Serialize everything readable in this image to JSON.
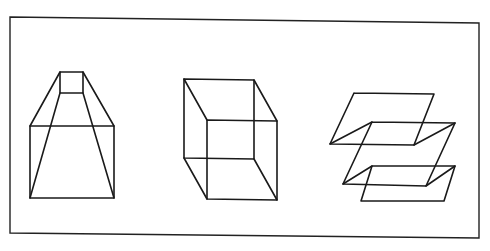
{
  "figure": {
    "frame": [
      [
        10,
        17
      ],
      [
        479,
        23
      ],
      [
        479,
        238
      ],
      [
        10,
        233
      ]
    ],
    "line_color": "#1a1a1a",
    "background": "#ffffff",
    "shapes": [
      {
        "name": "truncated-pyramid",
        "polylines": [
          [
            [
              60,
              72
            ],
            [
              83,
              72
            ],
            [
              83,
              93
            ],
            [
              60,
              93
            ],
            [
              60,
              72
            ]
          ],
          [
            [
              30,
              126
            ],
            [
              114,
              126
            ],
            [
              114,
              198
            ],
            [
              30,
              198
            ],
            [
              30,
              126
            ]
          ],
          [
            [
              60,
              72
            ],
            [
              30,
              126
            ]
          ],
          [
            [
              83,
              72
            ],
            [
              114,
              126
            ]
          ],
          [
            [
              60,
              93
            ],
            [
              30,
              198
            ]
          ],
          [
            [
              83,
              93
            ],
            [
              114,
              198
            ]
          ]
        ]
      },
      {
        "name": "necker-cube",
        "polylines": [
          [
            [
              184,
              79
            ],
            [
              254,
              80
            ],
            [
              254,
              159
            ],
            [
              184,
              158
            ],
            [
              184,
              79
            ]
          ],
          [
            [
              207,
              120
            ],
            [
              277,
              121
            ],
            [
              277,
              200
            ],
            [
              207,
              199
            ],
            [
              207,
              120
            ]
          ],
          [
            [
              184,
              79
            ],
            [
              207,
              120
            ]
          ],
          [
            [
              254,
              80
            ],
            [
              277,
              121
            ]
          ],
          [
            [
              184,
              158
            ],
            [
              207,
              199
            ]
          ],
          [
            [
              254,
              159
            ],
            [
              277,
              200
            ]
          ]
        ]
      },
      {
        "name": "stacked-planes",
        "polylines": [
          [
            [
              354,
              93
            ],
            [
              434,
              94
            ],
            [
              414,
              145
            ],
            [
              330,
              144
            ],
            [
              354,
              93
            ]
          ],
          [
            [
              372,
              122
            ],
            [
              455,
              123
            ],
            [
              426,
              186
            ],
            [
              343,
              184
            ],
            [
              372,
              122
            ]
          ],
          [
            [
              372,
              166
            ],
            [
              455,
              166
            ],
            [
              444,
              201
            ],
            [
              361,
              201
            ],
            [
              372,
              166
            ]
          ],
          [
            [
              330,
              144
            ],
            [
              372,
              122
            ]
          ],
          [
            [
              414,
              145
            ],
            [
              455,
              123
            ]
          ],
          [
            [
              343,
              184
            ],
            [
              372,
              166
            ]
          ],
          [
            [
              426,
              186
            ],
            [
              455,
              166
            ]
          ]
        ]
      }
    ]
  }
}
